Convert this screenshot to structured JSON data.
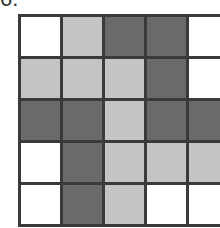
{
  "label": "6.",
  "grid": {
    "rows": 5,
    "cols": 5,
    "legend": {
      "W": "white",
      "L": "light gray",
      "D": "dark gray"
    },
    "cells": [
      [
        "W",
        "L",
        "D",
        "D",
        "W"
      ],
      [
        "L",
        "L",
        "L",
        "D",
        "W"
      ],
      [
        "D",
        "D",
        "L",
        "D",
        "D"
      ],
      [
        "W",
        "D",
        "L",
        "L",
        "L"
      ],
      [
        "W",
        "D",
        "L",
        "W",
        "W"
      ]
    ]
  }
}
